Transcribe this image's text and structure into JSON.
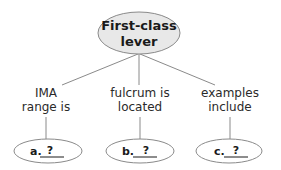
{
  "root": {
    "line1": "First-class",
    "line2": "lever",
    "fill": "#e8e8e8",
    "stroke": "#8a8a8a"
  },
  "branches": [
    {
      "label_line1": "IMA",
      "label_line2": "range is",
      "leaf_prefix": "a.",
      "leaf_blank": "?"
    },
    {
      "label_line1": "fulcrum is",
      "label_line2": "located",
      "leaf_prefix": "b.",
      "leaf_blank": "?"
    },
    {
      "label_line1": "examples",
      "label_line2": "include",
      "leaf_prefix": "c.",
      "leaf_blank": "?"
    }
  ],
  "colors": {
    "line": "#8a8a8a",
    "leaf_fill": "#ffffff"
  }
}
